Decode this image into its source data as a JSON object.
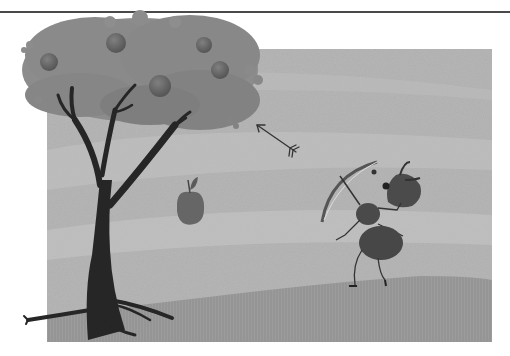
{
  "illustration": {
    "description": "Grayscale storybook illustration: an ant holding a bow stands on a grassy hill beside an apple tree; an arrow flies toward the tree and an apple falls.",
    "colors": {
      "page_background": "#ffffff",
      "top_rule": "#4a4a4a",
      "sky": "#b4b4b4",
      "sky_light": "#c6c6c6",
      "grass": "#9a9a9a",
      "canopy": "#8a8a8a",
      "canopy_dark": "#777777",
      "trunk": "#262626",
      "apple": "#6a6a6a",
      "ant": "#4a4a4a",
      "bow": "#5a5a5a"
    },
    "elements": {
      "tree": {
        "apples_on_tree": 5
      },
      "falling_apple": {
        "count": 1
      },
      "arrow": {
        "direction": "up-left"
      },
      "ant": {
        "holding": "bow"
      }
    }
  }
}
